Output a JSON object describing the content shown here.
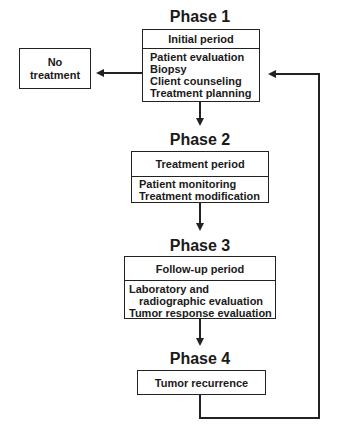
{
  "phases": [
    {
      "title": "Phase 1",
      "header": "Initial period",
      "items": [
        "Patient evaluation",
        "Biopsy",
        "Client counseling",
        "Treatment planning"
      ]
    },
    {
      "title": "Phase 2",
      "header": "Treatment period",
      "items": [
        "Patient monitoring",
        "Treatment modification"
      ]
    },
    {
      "title": "Phase 3",
      "header": "Follow-up period",
      "items": [
        "Laboratory and",
        "radiographic evaluation",
        "Tumor response evaluation"
      ]
    },
    {
      "title": "Phase 4",
      "header": "Tumor recurrence",
      "items": []
    }
  ],
  "side_box": {
    "line1": "No",
    "line2": "treatment"
  },
  "colors": {
    "line": "#222222",
    "background": "#ffffff"
  }
}
